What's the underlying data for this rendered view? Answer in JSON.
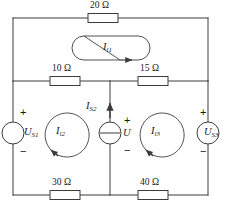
{
  "figure": {
    "type": "electrical-circuit-schematic",
    "line_color": "#3c3c3c",
    "text_color": "#1a1a1a",
    "background": "#ffffff"
  },
  "resistors": [
    {
      "name": "top-resistor",
      "label": "20 Ω",
      "value": 20,
      "unit": "Ω",
      "position": "top branch, center"
    },
    {
      "name": "middle-left-resistor",
      "label": "10 Ω",
      "value": 10,
      "unit": "Ω",
      "position": "middle branch, left"
    },
    {
      "name": "middle-right-resistor",
      "label": "15 Ω",
      "value": 15,
      "unit": "Ω",
      "position": "middle branch, right"
    },
    {
      "name": "bottom-left-resistor",
      "label": "30 Ω",
      "value": 30,
      "unit": "Ω",
      "position": "bottom branch, left"
    },
    {
      "name": "bottom-right-resistor",
      "label": "40 Ω",
      "value": 40,
      "unit": "Ω",
      "position": "bottom branch, right"
    }
  ],
  "sources": {
    "left_voltage": {
      "symbol": "U",
      "subscript": "S1",
      "label": "U",
      "plus": "+",
      "minus": "−",
      "polarity": "plus-top"
    },
    "right_voltage": {
      "symbol": "U",
      "subscript": "S3",
      "label": "U",
      "plus": "+",
      "minus": "−",
      "polarity": "plus-top"
    },
    "middle_current": {
      "symbol": "I",
      "subscript": "S2",
      "label": "I",
      "arrow_direction": "up",
      "terminal_voltage_symbol": "U",
      "plus": "+",
      "minus": "−",
      "polarity": "plus-top"
    }
  },
  "mesh_currents": [
    {
      "name": "mesh-current-top",
      "symbol": "I",
      "subscript": "l1",
      "direction": "clockwise",
      "shape": "stadium"
    },
    {
      "name": "mesh-current-left",
      "symbol": "I",
      "subscript": "l2",
      "direction": "counterclockwise",
      "shape": "circle"
    },
    {
      "name": "mesh-current-right",
      "symbol": "I",
      "subscript": "l3",
      "direction": "counterclockwise",
      "shape": "circle"
    }
  ]
}
